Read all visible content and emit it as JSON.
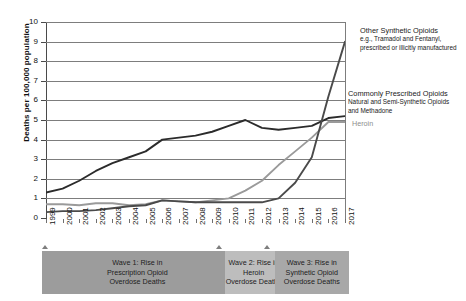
{
  "chart_data": {
    "type": "line",
    "title": "",
    "xlabel": "",
    "ylabel": "Deaths per 100,000 population",
    "ylim": [
      0,
      10
    ],
    "yticks": [
      0,
      1,
      2,
      3,
      4,
      5,
      6,
      7,
      8,
      9,
      10
    ],
    "grid": true,
    "legend_position": "right-annotations",
    "x": [
      1999,
      2000,
      2001,
      2002,
      2003,
      2004,
      2005,
      2006,
      2007,
      2008,
      2009,
      2010,
      2011,
      2012,
      2013,
      2014,
      2015,
      2016,
      2017
    ],
    "categories": [
      "1999",
      "2000",
      "2001",
      "2002",
      "2003",
      "2004",
      "2005",
      "2006",
      "2007",
      "2008",
      "2009",
      "2010",
      "2011",
      "2012",
      "2013",
      "2014",
      "2015",
      "2016",
      "2017"
    ],
    "series": [
      {
        "name": "Commonly Prescribed Opioids",
        "subtitle": "Natural and Semi-Synthetic Opioids and Methadone",
        "color": "#2b2b2b",
        "values": [
          1.3,
          1.5,
          1.9,
          2.4,
          2.8,
          3.1,
          3.4,
          4.0,
          4.1,
          4.2,
          4.4,
          4.7,
          5.0,
          4.6,
          4.5,
          4.6,
          4.7,
          5.1,
          5.2
        ]
      },
      {
        "name": "Heroin",
        "subtitle": "",
        "color": "#9a9a9a",
        "values": [
          0.7,
          0.7,
          0.65,
          0.75,
          0.75,
          0.65,
          0.7,
          0.9,
          0.85,
          0.8,
          0.9,
          1.0,
          1.4,
          1.9,
          2.7,
          3.4,
          4.1,
          4.9,
          4.9
        ]
      },
      {
        "name": "Other Synthetic Opioids",
        "subtitle": "e.g., Tramadol and Fentanyl, prescribed or illicitly manufactured",
        "color": "#4a4a4a",
        "values": [
          0.3,
          0.35,
          0.35,
          0.4,
          0.5,
          0.6,
          0.65,
          0.9,
          0.85,
          0.8,
          0.8,
          0.8,
          0.8,
          0.8,
          1.0,
          1.8,
          3.1,
          6.2,
          9.0
        ]
      }
    ],
    "annotations": [
      {
        "id": "other-synthetic-opioids",
        "title": "Other Synthetic Opioids",
        "line2": "e.g., Tramadol and Fentanyl,",
        "line3": "prescribed or illicitly manufactured"
      },
      {
        "id": "commonly-prescribed-opioids",
        "title": "Commonly Prescribed Opioids",
        "line2": "Natural and Semi-Synthetic Opioids",
        "line3": "and Methadone"
      },
      {
        "id": "heroin",
        "title": "Heroin"
      }
    ],
    "waves": [
      {
        "id": "wave-1",
        "line1": "Wave 1: Rise in",
        "line2": "Prescription Opioid",
        "line3": "Overdose Deaths",
        "color": "#9c9c9c",
        "start_year": 1999,
        "end_year": 2010
      },
      {
        "id": "wave-2",
        "line1": "Wave 2: Rise in Heroin",
        "line2": "Overdose Deaths",
        "line3": "",
        "color": "#bdbdbd",
        "start_year": 2010,
        "end_year": 2013
      },
      {
        "id": "wave-3",
        "line1": "Wave 3: Rise in",
        "line2": "Synthetic Opioid",
        "line3": "Overdose Deaths",
        "color": "#a8a8a8",
        "start_year": 2013,
        "end_year": 2017
      }
    ]
  }
}
